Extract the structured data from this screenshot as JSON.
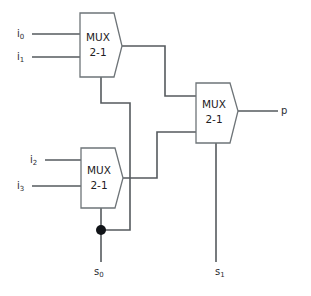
{
  "diagram": {
    "line_color": "#555a5e",
    "box_stroke_color": "#6e7478",
    "box_fill_color": "#ffffff",
    "text_color": "#1d2023",
    "junction_color": "#111418",
    "background": "#ffffff"
  },
  "muxes": [
    {
      "id": "mux-top",
      "label_line1": "MUX",
      "label_line2": "2-1",
      "x": 80,
      "y": 13,
      "width": 42,
      "height": 64,
      "inputs": [
        "i0",
        "i1"
      ],
      "select": "s0",
      "output_to": "mux-right"
    },
    {
      "id": "mux-bottom",
      "label_line1": "MUX",
      "label_line2": "2-1",
      "x": 81,
      "y": 148,
      "width": 42,
      "height": 60,
      "inputs": [
        "i2",
        "i3"
      ],
      "select": "s0",
      "output_to": "mux-right"
    },
    {
      "id": "mux-right",
      "label_line1": "MUX",
      "label_line2": "2-1",
      "x": 196,
      "y": 83,
      "width": 42,
      "height": 60,
      "inputs": [
        "mux-top",
        "mux-bottom"
      ],
      "select": "s1",
      "output_to": "p"
    }
  ],
  "ports": [
    {
      "id": "i0",
      "base": "i",
      "sub": "0",
      "x": 17,
      "y": 34,
      "kind": "input"
    },
    {
      "id": "i1",
      "base": "i",
      "sub": "1",
      "x": 17,
      "y": 57,
      "kind": "input"
    },
    {
      "id": "i2",
      "base": "i",
      "sub": "2",
      "x": 30,
      "y": 160,
      "kind": "input"
    },
    {
      "id": "i3",
      "base": "i",
      "sub": "3",
      "x": 17,
      "y": 186,
      "kind": "input"
    },
    {
      "id": "s0",
      "base": "s",
      "sub": "0",
      "x": 94,
      "y": 272,
      "kind": "select"
    },
    {
      "id": "s1",
      "base": "s",
      "sub": "1",
      "x": 215,
      "y": 272,
      "kind": "select"
    },
    {
      "id": "p",
      "base": "p",
      "sub": "",
      "x": 281,
      "y": 111,
      "kind": "output"
    }
  ],
  "wires": [
    {
      "id": "wire-i0",
      "from": "i0",
      "to": "mux-top.in0",
      "path": "M 32 34 L 80 34"
    },
    {
      "id": "wire-i1",
      "from": "i1",
      "to": "mux-top.in1",
      "path": "M 32 57 L 80 57"
    },
    {
      "id": "wire-i2",
      "from": "i2",
      "to": "mux-bottom.in0",
      "path": "M 45 160 L 81 160"
    },
    {
      "id": "wire-i3",
      "from": "i3",
      "to": "mux-bottom.in1",
      "path": "M 32 186 L 81 186"
    },
    {
      "id": "wire-mux-top-out",
      "from": "mux-top.out",
      "to": "mux-right.in0",
      "path": "M 122 46 L 165 46 L 165 96 L 196 96"
    },
    {
      "id": "wire-mux-bottom-out",
      "from": "mux-bottom.out",
      "to": "mux-right.in1",
      "path": "M 123 178 L 157 178 L 157 132 L 196 132"
    },
    {
      "id": "wire-mux-right-out",
      "from": "mux-right.out",
      "to": "p",
      "path": "M 238 111 L 278 111"
    },
    {
      "id": "wire-s0-top-select",
      "from": "junction-s0",
      "to": "mux-top.sel",
      "path": "M 101 77 L 101 103 L 130 103 L 130 230 L 101 230"
    },
    {
      "id": "wire-s0-bottom-select",
      "from": "junction-s0",
      "to": "mux-bottom.sel",
      "path": "M 101 208 L 101 230"
    },
    {
      "id": "wire-s0-stem",
      "from": "junction-s0",
      "to": "s0",
      "path": "M 101 230 L 101 262"
    },
    {
      "id": "wire-s1-select",
      "from": "s1",
      "to": "mux-right.sel",
      "path": "M 216 143 L 216 262"
    }
  ],
  "junctions": [
    {
      "id": "junction-s0",
      "x": 101,
      "y": 230,
      "r": 5,
      "label": "s0-fanout"
    }
  ]
}
